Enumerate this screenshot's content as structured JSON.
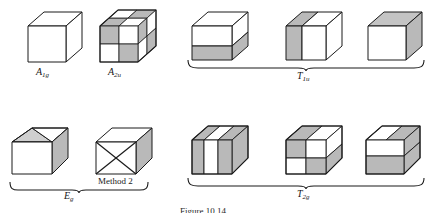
{
  "figure": {
    "caption": "Figure 10.14",
    "method_note": "Method 2",
    "colors": {
      "outline": "#1a1a1a",
      "shaded_face": "#b9b9b9",
      "shaded_face_dark": "#a8a8a8",
      "white_face": "#ffffff",
      "top_shade": "#cfcfcf",
      "side_shade": "#c4c4c4",
      "background": "#ffffff"
    }
  },
  "labels": {
    "a1g": {
      "main": "A",
      "sub": "1g"
    },
    "a2u": {
      "main": "A",
      "sub": "2u"
    },
    "t1u": {
      "main": "T",
      "sub": "1u"
    },
    "eg": {
      "main": "E",
      "sub": "g"
    },
    "t2g": {
      "main": "T",
      "sub": "2g"
    }
  },
  "groups": [
    {
      "id": "a1g",
      "label": "A1g",
      "braced": false,
      "cube_count": 1,
      "cubes": [
        {
          "pattern": "uniform-white",
          "description": "plain unshaded cube, totally symmetric"
        }
      ]
    },
    {
      "id": "a2u",
      "label": "A2u",
      "braced": false,
      "cube_count": 1,
      "cubes": [
        {
          "pattern": "checkerboard-3d",
          "description": "alternating shaded and white octants on all faces"
        }
      ]
    },
    {
      "id": "t1u",
      "label": "T1u",
      "braced": true,
      "cube_count": 3,
      "cubes": [
        {
          "pattern": "split-horizontal",
          "description": "front face white on top, shaded on bottom"
        },
        {
          "pattern": "split-vertical",
          "description": "front face shaded on left, white on right"
        },
        {
          "pattern": "split-depth",
          "description": "front face white, right side face shaded"
        }
      ]
    },
    {
      "id": "eg",
      "label": "Eg",
      "braced": true,
      "cube_count": 2,
      "cubes": [
        {
          "pattern": "diagonal-top",
          "description": "white front face with shaded side and folded diagonal top"
        },
        {
          "pattern": "x-cross-front",
          "description": "front face crossed by both diagonals forming an X",
          "note": "Method 2"
        }
      ]
    },
    {
      "id": "t2g",
      "label": "T2g",
      "braced": true,
      "cube_count": 3,
      "cubes": [
        {
          "pattern": "vertical-stripes",
          "description": "front face vertical bands shaded, white, shaded"
        },
        {
          "pattern": "quad-checker-front",
          "description": "front face 2x2 checkerboard of shaded and white quadrants"
        },
        {
          "pattern": "horizontal-bands",
          "description": "front face white upper band over shaded lower band"
        }
      ]
    }
  ]
}
